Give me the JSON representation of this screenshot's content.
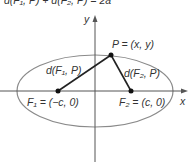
{
  "equation": {
    "text": "d(F₁, P) + d(F₂, P) = 2a"
  },
  "axes": {
    "x_label": "x",
    "y_label": "y"
  },
  "point_p": {
    "label": "P = (x, y)"
  },
  "focus1": {
    "label": "F₁ = (−c, 0)"
  },
  "focus2": {
    "label": "F₂ = (c, 0)"
  },
  "distance1": {
    "label": "d(F₁, P)"
  },
  "distance2": {
    "label": "d(F₂, P)"
  },
  "colors": {
    "ellipse": "#8a8a8a",
    "axes": "#555555",
    "segments": "#222222",
    "text": "#333333"
  }
}
